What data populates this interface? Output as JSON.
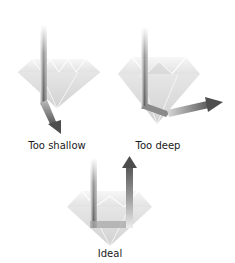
{
  "diagram": {
    "panels": [
      {
        "id": "too-shallow",
        "label": "Too shallow",
        "label_x": 57,
        "label_y": 140
      },
      {
        "id": "too-deep",
        "label": "Too deep",
        "label_x": 158,
        "label_y": 140
      },
      {
        "id": "ideal",
        "label": "Ideal",
        "label_x": 110,
        "label_y": 248
      }
    ],
    "colors": {
      "diamond_fill": "#e4e4e4",
      "diamond_facet": "#f2f2f2",
      "diamond_shadow": "#cfcfcf",
      "ray_dark": "#6e6e6e",
      "ray_light": "#f4f4f4",
      "label": "#1a1a1a"
    }
  }
}
